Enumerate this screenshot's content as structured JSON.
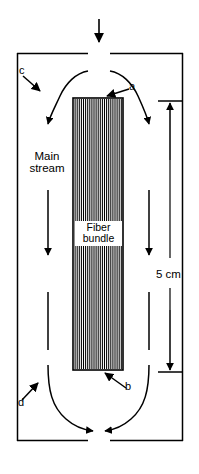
{
  "figure": {
    "type": "schematic-diagram",
    "background_color": "#ffffff",
    "stroke_color": "#000000"
  },
  "labels": {
    "main_stream_line1": "Main",
    "main_stream_line2": "stream",
    "fiber_bundle_line1": "Fiber",
    "fiber_bundle_line2": "bundle",
    "dimension_5cm": "5 cm",
    "callout_a": "a",
    "callout_b": "b",
    "callout_c": "c",
    "callout_d": "d"
  },
  "callouts": [
    {
      "id": "a",
      "text": "a",
      "points_to": "top-edge-of-fiber-bundle",
      "x": 132,
      "y": 88
    },
    {
      "id": "b",
      "text": "b",
      "points_to": "bottom-edge-of-fiber-bundle",
      "x": 128,
      "y": 388
    },
    {
      "id": "c",
      "text": "c",
      "points_to": "upper-left-recirculation-streamline",
      "x": 22,
      "y": 72
    },
    {
      "id": "d",
      "text": "d",
      "points_to": "lower-left-recirculation-streamline",
      "x": 21,
      "y": 404
    }
  ],
  "dimension": {
    "label": "5 cm",
    "measures": "fiber-bundle-height",
    "top_y": 101,
    "bottom_y": 372,
    "axis_x": 170
  },
  "fiber_bundle": {
    "label_line1": "Fiber",
    "label_line2": "bundle",
    "left": 73,
    "right": 123,
    "top": 98,
    "bottom": 370,
    "fiber_count": 23,
    "hatch": "vertical-lines"
  },
  "chamber": {
    "left": 17,
    "right": 183,
    "top": 53,
    "bottom": 441,
    "inlet_gap_left": 88,
    "inlet_gap_right": 110,
    "outlet_gap_left": 88,
    "outlet_gap_right": 110
  },
  "flow": {
    "inlet_arrow": "downward-inlet-arrow",
    "outlet_arrows": "converging-outlet-arrows",
    "main_stream_arrows": "two-vertical-downward-arrows",
    "streamlines": "four-curved-recirculation-streamlines"
  },
  "colors": {
    "ink": "#000000",
    "paper": "#ffffff"
  }
}
